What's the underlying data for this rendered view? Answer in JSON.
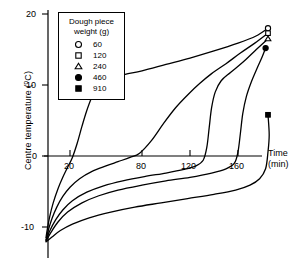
{
  "chart_data": {
    "type": "line",
    "title": "",
    "xlabel": "Time (min)",
    "ylabel": "Centre temperature (°C)",
    "xlim": [
      0,
      200
    ],
    "ylim": [
      -12,
      20
    ],
    "grid": false,
    "legend_position": "top-left",
    "legend_title": "Dough piece weight (g)",
    "xticks": [
      20,
      80,
      120,
      160
    ],
    "yticks": [
      20,
      10,
      0,
      -10
    ],
    "series": [
      {
        "name": "60",
        "marker": "open-circle",
        "end_marker_point": [
          185,
          18.0
        ],
        "points": [
          [
            0,
            -11.5
          ],
          [
            1,
            -10.4
          ],
          [
            3,
            -8.6
          ],
          [
            6,
            -6.6
          ],
          [
            10,
            -4.6
          ],
          [
            14,
            -3.0
          ],
          [
            18,
            -1.6
          ],
          [
            22,
            -0.2
          ],
          [
            26,
            1.8
          ],
          [
            30,
            4.2
          ],
          [
            34,
            6.4
          ],
          [
            38,
            8.2
          ],
          [
            42,
            9.4
          ],
          [
            48,
            10.4
          ],
          [
            56,
            11.0
          ],
          [
            66,
            11.5
          ],
          [
            80,
            12.0
          ],
          [
            100,
            12.9
          ],
          [
            120,
            13.8
          ],
          [
            140,
            14.8
          ],
          [
            160,
            15.9
          ],
          [
            175,
            16.9
          ],
          [
            185,
            18.0
          ]
        ]
      },
      {
        "name": "120",
        "marker": "open-square",
        "end_marker_point": [
          185,
          17.3
        ],
        "points": [
          [
            0,
            -11.8
          ],
          [
            2,
            -10.4
          ],
          [
            5,
            -8.8
          ],
          [
            9,
            -7.2
          ],
          [
            14,
            -5.7
          ],
          [
            20,
            -4.4
          ],
          [
            28,
            -3.2
          ],
          [
            38,
            -2.2
          ],
          [
            50,
            -1.4
          ],
          [
            60,
            -0.8
          ],
          [
            70,
            -0.2
          ],
          [
            78,
            0.4
          ],
          [
            88,
            2.2
          ],
          [
            98,
            4.6
          ],
          [
            108,
            6.8
          ],
          [
            118,
            8.6
          ],
          [
            128,
            10.2
          ],
          [
            138,
            11.6
          ],
          [
            150,
            13.0
          ],
          [
            162,
            14.5
          ],
          [
            174,
            15.9
          ],
          [
            185,
            17.3
          ]
        ]
      },
      {
        "name": "240",
        "marker": "open-triangle",
        "end_marker_point": [
          185,
          16.5
        ],
        "points": [
          [
            0,
            -11.9
          ],
          [
            3,
            -10.6
          ],
          [
            8,
            -9.0
          ],
          [
            14,
            -7.6
          ],
          [
            22,
            -6.3
          ],
          [
            34,
            -5.1
          ],
          [
            48,
            -4.2
          ],
          [
            64,
            -3.5
          ],
          [
            82,
            -2.9
          ],
          [
            100,
            -2.4
          ],
          [
            115,
            -1.9
          ],
          [
            125,
            -1.4
          ],
          [
            131,
            -0.6
          ],
          [
            134,
            1.2
          ],
          [
            136,
            4.0
          ],
          [
            138,
            6.8
          ],
          [
            141,
            9.0
          ],
          [
            146,
            10.6
          ],
          [
            154,
            11.8
          ],
          [
            164,
            13.2
          ],
          [
            174,
            14.8
          ],
          [
            185,
            16.5
          ]
        ]
      },
      {
        "name": "460",
        "marker": "filled-circle",
        "end_marker_point": [
          183,
          15.2
        ],
        "points": [
          [
            0,
            -12.0
          ],
          [
            4,
            -10.8
          ],
          [
            10,
            -9.3
          ],
          [
            18,
            -7.9
          ],
          [
            30,
            -6.6
          ],
          [
            44,
            -5.6
          ],
          [
            60,
            -4.8
          ],
          [
            80,
            -4.1
          ],
          [
            100,
            -3.5
          ],
          [
            120,
            -3.0
          ],
          [
            138,
            -2.4
          ],
          [
            150,
            -1.8
          ],
          [
            157,
            -1.0
          ],
          [
            160,
            0.6
          ],
          [
            162,
            3.2
          ],
          [
            164,
            6.0
          ],
          [
            167,
            8.4
          ],
          [
            171,
            10.4
          ],
          [
            176,
            12.4
          ],
          [
            180,
            13.9
          ],
          [
            183,
            15.2
          ]
        ]
      },
      {
        "name": "910",
        "marker": "filled-square",
        "end_marker_point": [
          185,
          5.8
        ],
        "points": [
          [
            0,
            -12.1
          ],
          [
            5,
            -11.4
          ],
          [
            12,
            -10.5
          ],
          [
            22,
            -9.6
          ],
          [
            36,
            -8.7
          ],
          [
            54,
            -7.9
          ],
          [
            74,
            -7.2
          ],
          [
            96,
            -6.6
          ],
          [
            118,
            -6.0
          ],
          [
            140,
            -5.4
          ],
          [
            158,
            -4.8
          ],
          [
            170,
            -4.1
          ],
          [
            178,
            -3.2
          ],
          [
            183,
            -1.8
          ],
          [
            185,
            0.6
          ],
          [
            186,
            3.0
          ],
          [
            185,
            5.8
          ]
        ]
      }
    ]
  },
  "axes": {
    "y_title": "Centre temperature (",
    "y_title_sup": "o",
    "y_title_tail": "C)",
    "x_title_line1": "Time",
    "x_title_line2": "(min)",
    "ytick_20": "20",
    "ytick_10": "10",
    "ytick_0": "0",
    "ytick_neg10": "-10",
    "xtick_20": "20",
    "xtick_80": "80",
    "xtick_120": "120",
    "xtick_160": "160"
  },
  "legend": {
    "title_line1": "Dough piece",
    "title_line2": "weight (g)",
    "entries": [
      {
        "marker": "open-circle",
        "label": "60"
      },
      {
        "marker": "open-square",
        "label": "120"
      },
      {
        "marker": "open-triangle",
        "label": "240"
      },
      {
        "marker": "filled-circle",
        "label": "460"
      },
      {
        "marker": "filled-square",
        "label": "910"
      }
    ]
  },
  "colors": {
    "line": "#000000",
    "axis": "#000000",
    "background": "#ffffff"
  }
}
